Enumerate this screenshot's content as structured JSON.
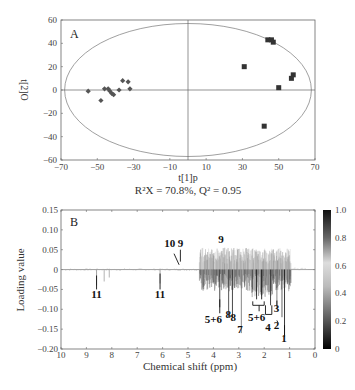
{
  "chart_data": [
    {
      "panel": "A",
      "type": "scatter",
      "panel_label": "A",
      "xlabel": "t[1]p",
      "ylabel": "t[2]O",
      "xlim": [
        -70,
        70
      ],
      "ylim": [
        -60,
        60
      ],
      "xticks": [
        -70,
        -50,
        -30,
        -10,
        10,
        30,
        50,
        70
      ],
      "yticks": [
        60,
        40,
        20,
        0,
        -20,
        -40,
        -60
      ],
      "grid": false,
      "caption": "R²X = 70.8%, Q² = 0.95",
      "ellipse": {
        "cx": 0,
        "rx": 68,
        "ry": 57
      },
      "series": [
        {
          "name": "group-diamond",
          "marker": "diamond",
          "color": "#555555",
          "points": [
            [
              -55,
              -1
            ],
            [
              -48,
              -9
            ],
            [
              -46,
              1
            ],
            [
              -44,
              1
            ],
            [
              -43,
              -1
            ],
            [
              -42,
              -3
            ],
            [
              -41,
              -4
            ],
            [
              -38,
              0
            ],
            [
              -36,
              8
            ],
            [
              -33,
              7
            ],
            [
              -32,
              1
            ]
          ]
        },
        {
          "name": "group-square",
          "marker": "square",
          "color": "#333333",
          "points": [
            [
              44,
              43
            ],
            [
              46,
              43
            ],
            [
              47,
              41
            ],
            [
              31,
              20
            ],
            [
              57,
              10
            ],
            [
              58,
              13
            ],
            [
              50,
              2
            ],
            [
              42,
              -31
            ]
          ]
        }
      ]
    },
    {
      "panel": "B",
      "type": "line",
      "panel_label": "B",
      "xlabel": "Chemical shift (ppm)",
      "ylabel": "Loading value",
      "xlim": [
        10,
        0
      ],
      "ylim": [
        -0.2,
        0.15
      ],
      "xticks": [
        10,
        9,
        8,
        7,
        6,
        5,
        4,
        3,
        2,
        1,
        0
      ],
      "yticks": [
        "0.15",
        "0.10",
        "0.05",
        "0",
        "−0.05",
        "−0.10",
        "−0.15",
        "−0.20"
      ],
      "colorbar": {
        "min": 0,
        "max": 1.0,
        "ticks": [
          "1.0",
          "0.8",
          "0.6",
          "0.4",
          "0.2",
          "0"
        ]
      },
      "annotations": [
        {
          "label": "11",
          "x": 8.6,
          "y": -0.065
        },
        {
          "label": "11",
          "x": 6.1,
          "y": -0.065
        },
        {
          "label": "10",
          "x": 5.55,
          "y": 0.07
        },
        {
          "label": "9",
          "x": 5.3,
          "y": 0.07
        },
        {
          "label": "9",
          "x": 3.7,
          "y": 0.065
        },
        {
          "label": "5+6",
          "x": 3.75,
          "y": -0.13
        },
        {
          "label": "8",
          "x": 3.35,
          "y": -0.12
        },
        {
          "label": "8",
          "x": 3.2,
          "y": -0.13
        },
        {
          "label": "7",
          "x": 2.9,
          "y": -0.16
        },
        {
          "label": "5+6",
          "x": 2.2,
          "y": -0.13
        },
        {
          "label": "4",
          "x": 1.85,
          "y": -0.155
        },
        {
          "label": "3",
          "x": 1.55,
          "y": -0.105
        },
        {
          "label": "2",
          "x": 1.5,
          "y": -0.15
        },
        {
          "label": "1",
          "x": 1.2,
          "y": -0.18
        }
      ]
    }
  ]
}
